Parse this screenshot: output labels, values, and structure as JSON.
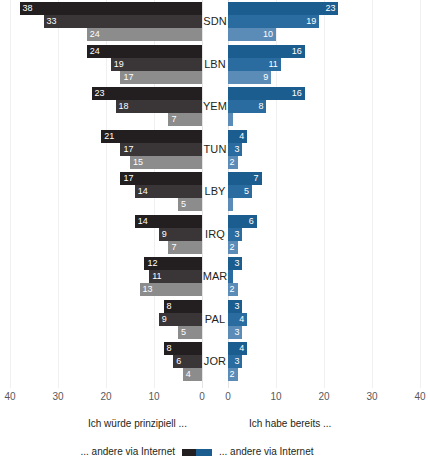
{
  "chart_data": {
    "type": "bar",
    "title": "",
    "subtitle": "",
    "orientation": "horizontal-diverging",
    "xlabel": "",
    "ylabel": "",
    "xlim_left": [
      40,
      0
    ],
    "xlim_right": [
      0,
      40
    ],
    "grid": true,
    "legend_position": "bottom",
    "categories": [
      "SDN",
      "LBN",
      "YEM",
      "TUN",
      "LBY",
      "IRQ",
      "MAR",
      "PAL",
      "JOR"
    ],
    "panels": [
      {
        "name": "left",
        "heading": "Ich würde prinzipiell ...",
        "direction": "left",
        "axis_ticks": [
          "40",
          "30",
          "20",
          "10",
          "0"
        ],
        "series": [
          {
            "name": "... andere via Internet",
            "color": "#231f20",
            "values": [
              38,
              24,
              23,
              21,
              17,
              14,
              12,
              8,
              8
            ]
          },
          {
            "name": "... andere via Internet",
            "color": "#3a3536",
            "values": [
              33,
              19,
              18,
              17,
              14,
              9,
              11,
              9,
              6
            ]
          },
          {
            "name": "... andere via Internet",
            "color": "#8c8c8c",
            "values": [
              24,
              17,
              7,
              15,
              5,
              7,
              13,
              5,
              4
            ]
          }
        ]
      },
      {
        "name": "right",
        "heading": "Ich habe bereits ...",
        "direction": "right",
        "axis_ticks": [
          "0",
          "10",
          "20",
          "30",
          "40"
        ],
        "series": [
          {
            "name": "... andere via Internet",
            "color": "#1b5d8e",
            "values": [
              23,
              16,
              16,
              4,
              7,
              6,
              3,
              3,
              4
            ]
          },
          {
            "name": "... andere via Internet",
            "color": "#2a6ca0",
            "values": [
              19,
              11,
              8,
              3,
              5,
              3,
              1,
              4,
              3
            ]
          },
          {
            "name": "... andere via Internet",
            "color": "#5b8cb8",
            "values": [
              10,
              9,
              1,
              2,
              1,
              2,
              2,
              3,
              2
            ]
          }
        ]
      }
    ],
    "data_labels_hidden_below": 2
  },
  "axis": {
    "left_ticks": [
      {
        "label": "40",
        "x": 10
      },
      {
        "label": "30",
        "x": 58
      },
      {
        "label": "20",
        "x": 106
      },
      {
        "label": "10",
        "x": 154
      },
      {
        "label": "0",
        "x": 202
      }
    ],
    "right_ticks": [
      {
        "label": "0",
        "x": 228
      },
      {
        "label": "10",
        "x": 276
      },
      {
        "label": "20",
        "x": 324
      },
      {
        "label": "30",
        "x": 372
      },
      {
        "label": "40",
        "x": 420
      }
    ]
  },
  "legend": {
    "left_heading": "Ich würde prinzipiell ...",
    "right_heading": "Ich habe bereits ...",
    "left_entry": "... andere via Internet",
    "right_entry": "... andere via Internet",
    "left_swatch_color": "#231f20",
    "right_swatch_color": "#1b5d8e"
  },
  "colors": {
    "background": "#ffffff",
    "gridline": "#f0f0f0",
    "axis_text": "#58585a",
    "label_text": "#231f20",
    "value_text": "#ffffff"
  }
}
